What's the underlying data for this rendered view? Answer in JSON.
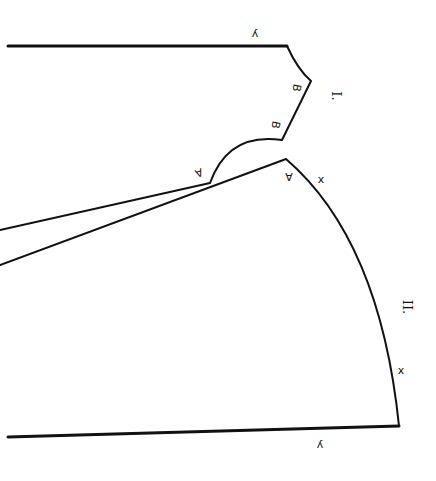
{
  "diagram": {
    "stroke_color": "#111111",
    "background": "#ffffff",
    "pieces": [
      {
        "id": "I",
        "roman_label": "I.",
        "edge_labels": {
          "y": "y",
          "b1": "B",
          "b2": "B",
          "a": "A"
        }
      },
      {
        "id": "II",
        "roman_label": "II.",
        "edge_labels": {
          "a": "A",
          "x1": "x",
          "x2": "x",
          "y": "y"
        }
      }
    ]
  }
}
